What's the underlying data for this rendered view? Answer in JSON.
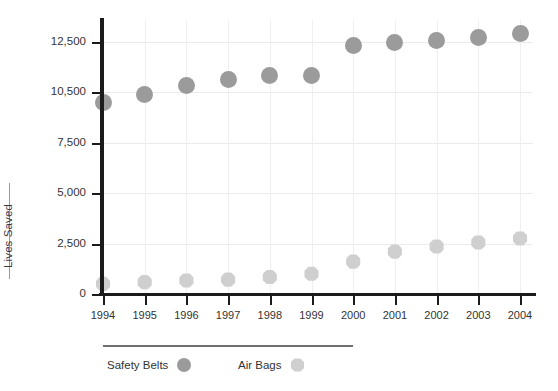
{
  "chart_data": {
    "type": "scatter",
    "title": "",
    "xlabel": "",
    "ylabel": "Lives Saved",
    "grid": true,
    "legend_position": "bottom-left",
    "categories": [
      "1994",
      "1995",
      "1996",
      "1997",
      "1998",
      "1999",
      "2000",
      "2001",
      "2002",
      "2003",
      "2004"
    ],
    "x": [
      1994,
      1995,
      1996,
      1997,
      1998,
      1999,
      2000,
      2001,
      2002,
      2003,
      2004
    ],
    "ytick_labels": [
      "0",
      "2,500",
      "5,000",
      "7,500",
      "10,500",
      "12,500"
    ],
    "ytick_values": [
      0,
      2500,
      5000,
      7500,
      10500,
      12500
    ],
    "ylim": [
      0,
      12500
    ],
    "series": [
      {
        "name": "Safety Belts",
        "color": "#9b9b9b",
        "marker": "circle",
        "values": [
          9900,
          10350,
          10750,
          11000,
          11150,
          11150,
          12350,
          12450,
          12550,
          12650,
          12800
        ]
      },
      {
        "name": "Air Bags",
        "color": "#cfcfcf",
        "marker": "octagon",
        "values": [
          500,
          590,
          670,
          710,
          840,
          1000,
          1600,
          2100,
          2350,
          2550,
          2750
        ]
      }
    ]
  },
  "legend": {
    "items": [
      {
        "label": "Safety Belts",
        "swatch": "circle-dark-gray"
      },
      {
        "label": "Air Bags",
        "swatch": "octagon-light-gray"
      }
    ]
  },
  "axes": {
    "y_title": "Lives Saved"
  },
  "colors": {
    "safety_belts": "#9b9b9b",
    "air_bags": "#cfcfcf",
    "axis": "#1b1b1b",
    "grid": "#eceaea",
    "text": "#333333"
  }
}
